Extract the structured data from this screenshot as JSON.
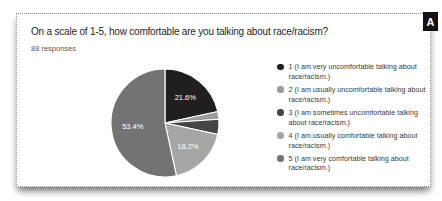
{
  "page": {
    "panel_label": "A"
  },
  "card": {
    "title": "On a scale of 1-5, how comfortable are you talking about race/racism?",
    "responses_label": "88 responses"
  },
  "chart_data": {
    "type": "pie",
    "title": "On a scale of 1-5, how comfortable are you talking about race/racism?",
    "responses_total": 88,
    "start_angle_deg": 0,
    "direction": "clockwise",
    "legend_position": "right",
    "slices": [
      {
        "label": "1 (I am very uncomfortable talking about race/racism.)",
        "percent": 21.6,
        "display_percent": "21.6%",
        "color": "#1f1f1f"
      },
      {
        "label": "2 (I am usually uncomfortable talking about race/racism.)",
        "percent": 2.3,
        "display_percent": "",
        "color": "#9b9b9b"
      },
      {
        "label": "3 (I am sometimes uncomfortable talking about race/racism.)",
        "percent": 4.5,
        "display_percent": "",
        "color": "#454545"
      },
      {
        "label": "4 (I am usually comfortable talking about race/racism.)",
        "percent": 18.2,
        "display_percent": "18.2%",
        "color": "#a6a6a6"
      },
      {
        "label": "5 (I am very comfortable talking about race/racism.)",
        "percent": 53.4,
        "display_percent": "53.4%",
        "color": "#737373"
      }
    ]
  }
}
